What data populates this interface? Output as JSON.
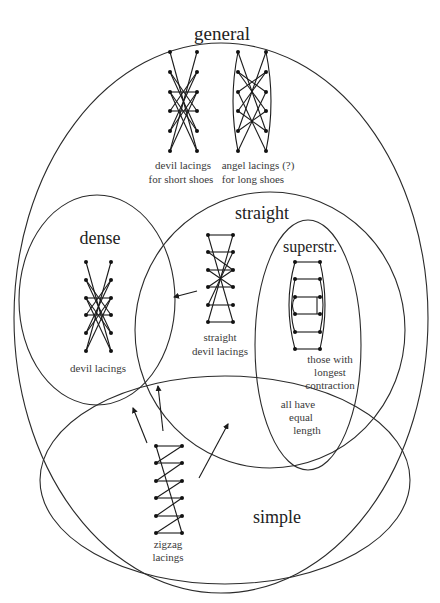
{
  "sets": {
    "general": {
      "title": "general"
    },
    "dense": {
      "title": "dense"
    },
    "straight": {
      "title": "straight"
    },
    "superstraight": {
      "title": "superstr."
    },
    "simple": {
      "title": "simple"
    }
  },
  "captions": {
    "devil_short": [
      "devil lacings",
      "for short shoes"
    ],
    "angel_long": [
      "angel lacings (?)",
      "for long shoes"
    ],
    "devil": [
      "devil lacings"
    ],
    "straight_devil": [
      "straight",
      "devil lacings"
    ],
    "longest_contraction": [
      "those with",
      "longest",
      "contraction"
    ],
    "equal_length": [
      "all have",
      "equal",
      "length"
    ],
    "zigzag": [
      "zigzag",
      "lacings"
    ]
  },
  "colors": {
    "stroke": "#2b2b2b",
    "eyelet": "#111111",
    "text": "#222222"
  },
  "arrows": [
    {
      "from": "straight devil lacings",
      "to": "dense"
    },
    {
      "from": "zigzag lacings",
      "to": "dense"
    },
    {
      "from": "zigzag lacings",
      "to": "dense ∩ straight"
    },
    {
      "from": "zigzag lacings",
      "to": "straight ∩ simple"
    }
  ]
}
